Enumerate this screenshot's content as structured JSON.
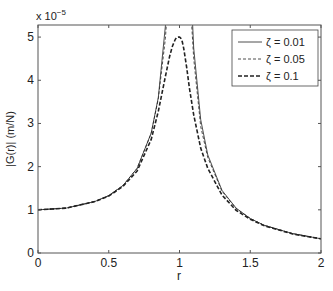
{
  "chart_data": {
    "type": "line",
    "title": "",
    "xlabel": "r",
    "ylabel": "|G(r)| (m/N)",
    "y_multiplier_label": "x 10",
    "y_multiplier_exp": "−5",
    "xlim": [
      0,
      2
    ],
    "ylim": [
      0,
      5.28
    ],
    "xticks": [
      0,
      0.5,
      1,
      1.5,
      2
    ],
    "xtick_labels": [
      "0",
      "0.5",
      "1",
      "1.5",
      "2"
    ],
    "yticks": [
      0,
      1,
      2,
      3,
      4,
      5
    ],
    "ytick_labels": [
      "0",
      "1",
      "2",
      "3",
      "4",
      "5"
    ],
    "grid": false,
    "legend_position": "upper right",
    "x": [
      0,
      0.2,
      0.4,
      0.5,
      0.6,
      0.7,
      0.8,
      0.85,
      0.9,
      0.93,
      0.95,
      0.97,
      0.98,
      0.99,
      0.995,
      1.0,
      1.005,
      1.01,
      1.02,
      1.03,
      1.05,
      1.07,
      1.1,
      1.15,
      1.2,
      1.3,
      1.4,
      1.5,
      1.6,
      1.8,
      2.0
    ],
    "series": [
      {
        "name": "ζ = 0.01",
        "style": "solid",
        "width": 0.8,
        "values": [
          0.1,
          0.104,
          0.119,
          0.133,
          0.156,
          0.196,
          0.278,
          0.36,
          0.526,
          0.736,
          1.022,
          1.616,
          2.374,
          4.159,
          5.352,
          5.0,
          3.902,
          3.507,
          2.425,
          1.631,
          0.974,
          0.693,
          0.475,
          0.309,
          0.227,
          0.145,
          0.104,
          0.08,
          0.064,
          0.045,
          0.033
        ]
      },
      {
        "name": "ζ = 0.05",
        "style": "dotted",
        "width": 0.8,
        "values": [
          0.1,
          0.104,
          0.119,
          0.133,
          0.156,
          0.196,
          0.277,
          0.357,
          0.497,
          0.641,
          0.784,
          0.907,
          0.955,
          0.988,
          0.997,
          1.0,
          0.996,
          0.987,
          0.95,
          0.893,
          0.761,
          0.617,
          0.451,
          0.293,
          0.221,
          0.143,
          0.103,
          0.08,
          0.064,
          0.045,
          0.033
        ]
      },
      {
        "name": "ζ = 0.1",
        "style": "dashed",
        "width": 1.6,
        "values": [
          0.1,
          0.104,
          0.119,
          0.132,
          0.154,
          0.19,
          0.263,
          0.328,
          0.409,
          0.455,
          0.479,
          0.495,
          0.499,
          0.5,
          0.5,
          0.5,
          0.499,
          0.497,
          0.489,
          0.474,
          0.431,
          0.382,
          0.32,
          0.243,
          0.196,
          0.134,
          0.099,
          0.078,
          0.063,
          0.044,
          0.033
        ]
      }
    ],
    "value_scale": "values listed in units of 1e-4 m/N scaled so plotted axis reads 0-5 (×10^-5); multiply by 10 for axis units"
  }
}
